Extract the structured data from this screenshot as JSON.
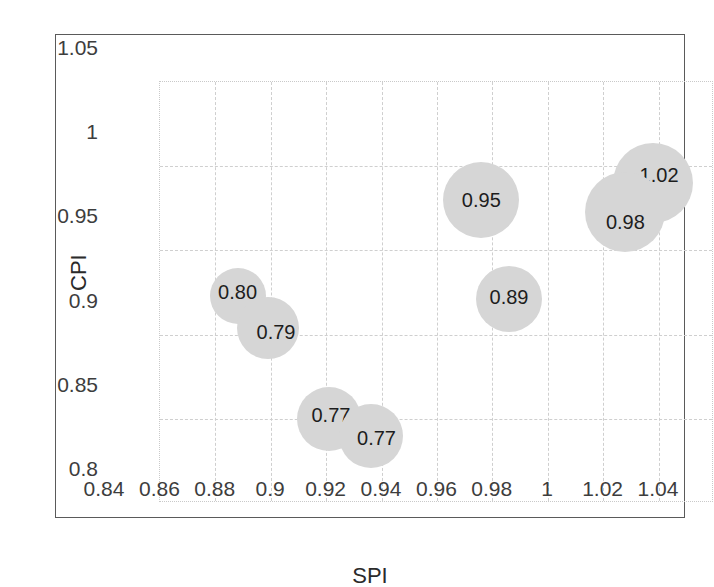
{
  "chart_data": {
    "type": "scatter",
    "title": "",
    "xlabel": "SPI",
    "ylabel": "CPI",
    "xlim": [
      0.84,
      1.04
    ],
    "ylim": [
      0.8,
      1.05
    ],
    "grid": true,
    "legend": "none",
    "xticks": [
      "0.84",
      "0.86",
      "0.88",
      "0.9",
      "0.92",
      "0.94",
      "0.96",
      "0.98",
      "1",
      "1.02",
      "1.04"
    ],
    "xtick_values": [
      0.84,
      0.86,
      0.88,
      0.9,
      0.92,
      0.94,
      0.96,
      0.98,
      1.0,
      1.02,
      1.04
    ],
    "yticks": [
      "0.8",
      "0.85",
      "0.9",
      "0.95",
      "1",
      "1.05"
    ],
    "ytick_values": [
      0.8,
      0.85,
      0.9,
      0.95,
      1.0,
      1.05
    ],
    "marker_color": "#d6d6d6",
    "label_color": "#1d1d1d",
    "points": [
      {
        "label": "0.80",
        "x": 0.868,
        "y": 0.923,
        "r_px": 28,
        "label_dx": 0,
        "label_dy": -4
      },
      {
        "label": "0.79",
        "x": 0.879,
        "y": 0.904,
        "r_px": 31,
        "label_dx": 8,
        "label_dy": 4
      },
      {
        "label": "0.77",
        "x": 0.901,
        "y": 0.85,
        "r_px": 32,
        "label_dx": 2,
        "label_dy": -4
      },
      {
        "label": "0.77",
        "x": 0.916,
        "y": 0.84,
        "r_px": 32,
        "label_dx": 6,
        "label_dy": 2
      },
      {
        "label": "0.95",
        "x": 0.956,
        "y": 0.98,
        "r_px": 38,
        "label_dx": 0,
        "label_dy": 0
      },
      {
        "label": "0.89",
        "x": 0.966,
        "y": 0.921,
        "r_px": 33,
        "label_dx": 0,
        "label_dy": -2
      },
      {
        "label": "1.02",
        "x": 1.018,
        "y": 0.99,
        "r_px": 40,
        "label_dx": 6,
        "label_dy": -8
      },
      {
        "label": "0.98",
        "x": 1.008,
        "y": 0.973,
        "r_px": 40,
        "label_dx": 0,
        "label_dy": 10
      }
    ]
  }
}
